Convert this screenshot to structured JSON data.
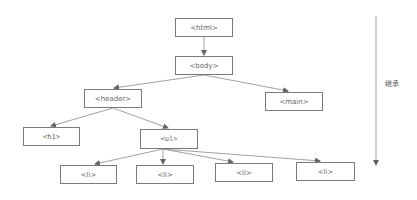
{
  "diagram": {
    "type": "tree",
    "nodes": [
      {
        "id": "html",
        "label": "<html>",
        "x": 175,
        "y": 18,
        "w": 58,
        "h": 19
      },
      {
        "id": "body",
        "label": "<body>",
        "x": 175,
        "y": 56,
        "w": 58,
        "h": 19
      },
      {
        "id": "header",
        "label": "<header>",
        "x": 84,
        "y": 89,
        "w": 58,
        "h": 19
      },
      {
        "id": "main",
        "label": "<main>",
        "x": 265,
        "y": 92,
        "w": 58,
        "h": 19
      },
      {
        "id": "h1",
        "label": "<h1>",
        "x": 23,
        "y": 127,
        "w": 57,
        "h": 19
      },
      {
        "id": "ul",
        "label": "<ul>",
        "x": 140,
        "y": 129,
        "w": 58,
        "h": 20
      },
      {
        "id": "li1",
        "label": "<li>",
        "x": 60,
        "y": 165,
        "w": 57,
        "h": 19
      },
      {
        "id": "li2",
        "label": "<li>",
        "x": 136,
        "y": 165,
        "w": 58,
        "h": 19
      },
      {
        "id": "li3",
        "label": "<li>",
        "x": 215,
        "y": 163,
        "w": 58,
        "h": 19
      },
      {
        "id": "li4",
        "label": "<li>",
        "x": 296,
        "y": 162,
        "w": 59,
        "h": 19
      }
    ],
    "edges": [
      [
        "html",
        "body"
      ],
      [
        "body",
        "header"
      ],
      [
        "body",
        "main"
      ],
      [
        "header",
        "h1"
      ],
      [
        "header",
        "ul"
      ],
      [
        "ul",
        "li1"
      ],
      [
        "ul",
        "li2"
      ],
      [
        "ul",
        "li3"
      ],
      [
        "ul",
        "li4"
      ]
    ],
    "side_arrow": {
      "label": "继承",
      "x": 376,
      "y1": 16,
      "y2": 165
    },
    "colors": {
      "line": "#8a8a8a",
      "border": "#7a7a7a",
      "text": "#666666"
    }
  }
}
